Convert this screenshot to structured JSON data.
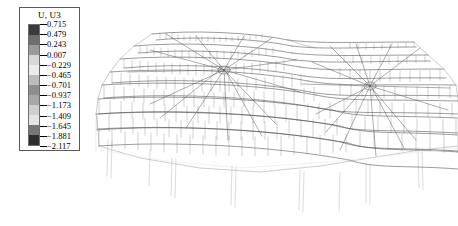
{
  "plot": {
    "kind": "fea-contour-deformed-mesh",
    "background_color": "#ffffff",
    "description": "Deformed wireframe mesh of a double-peak tensile roof / cable-net shell structure shown in perspective view with vertical support columns."
  },
  "legend": {
    "title": "U, U3",
    "border_color": "#5a5a5a",
    "text_color": "#000000",
    "labels": [
      "0.715",
      "0.479",
      "0.243",
      "0.007",
      "−0.229",
      "−0.465",
      "−0.701",
      "−0.937",
      "−1.173",
      "−1.409",
      "−1.645",
      "−1.881",
      "−2.117"
    ],
    "swatch_colors": [
      "#3a3a3a",
      "#6e6e6e",
      "#9a9a9a",
      "#d8d8d8",
      "#ececec",
      "#bcbcbc",
      "#8e8e8e",
      "#a8a8a8",
      "#cfcfcf",
      "#e4e4e4",
      "#767676",
      "#2e2e2e"
    ]
  },
  "chart_data": {
    "type": "heatmap",
    "title": "U, U3",
    "xlabel": "",
    "ylabel": "",
    "legend_position": "left",
    "grid": false,
    "contour_levels": [
      0.715,
      0.479,
      0.243,
      0.007,
      -0.229,
      -0.465,
      -0.701,
      -0.937,
      -1.173,
      -1.409,
      -1.645,
      -1.881,
      -2.117
    ],
    "value_min": -2.117,
    "value_max": 0.715,
    "level_step": 0.236,
    "band_count": 12,
    "units": "displacement",
    "component": "U3",
    "colormap": "grayscale"
  },
  "mesh_geometry": {
    "ribs": 13,
    "apex_count": 2,
    "apex_positions": [
      [
        224,
        70
      ],
      [
        370,
        86
      ]
    ],
    "column_count": 8,
    "line_color": "#4a4a4a",
    "hatch_color": "#6a6a6a",
    "column_color": "#cfcfcf"
  }
}
